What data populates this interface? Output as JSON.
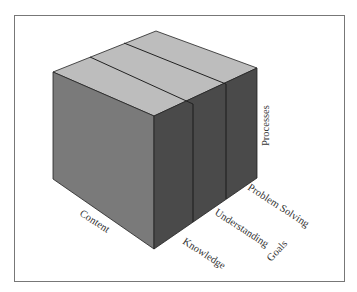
{
  "diagram": {
    "type": "3d-cube-model",
    "axes": {
      "vertical": "Processes",
      "depth": "Content",
      "horizontal": "Goals"
    },
    "goal_slices": [
      "Knowledge",
      "Understanding",
      "Problem Solving"
    ],
    "labels": {
      "processes": "Processes",
      "content": "Content",
      "goals": "Goals",
      "knowledge": "Knowledge",
      "understanding": "Understanding",
      "problem_solving": "Problem Solving"
    },
    "colors": {
      "top_face": "#bdbdbd",
      "left_face": "#7a7a7a",
      "right_face": "#4a4a4a",
      "edges": "#222222",
      "frame": "#777777"
    }
  }
}
